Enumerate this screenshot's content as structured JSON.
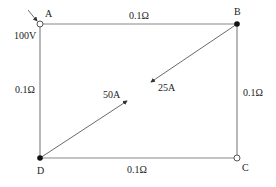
{
  "diagram": {
    "type": "circuit-network",
    "nodes": [
      {
        "id": "A",
        "label": "A",
        "x": 40,
        "y": 24,
        "style": "open"
      },
      {
        "id": "B",
        "label": "B",
        "x": 237,
        "y": 24,
        "style": "filled"
      },
      {
        "id": "C",
        "label": "C",
        "x": 237,
        "y": 158,
        "style": "open"
      },
      {
        "id": "D",
        "label": "D",
        "x": 40,
        "y": 158,
        "style": "filled"
      }
    ],
    "branches": [
      {
        "from": "A",
        "to": "B",
        "resistance": "0.1Ω"
      },
      {
        "from": "B",
        "to": "C",
        "resistance": "0.1Ω"
      },
      {
        "from": "D",
        "to": "C",
        "resistance": "0.1Ω"
      },
      {
        "from": "A",
        "to": "D",
        "resistance": "0.1Ω"
      }
    ],
    "source": {
      "node": "A",
      "voltage": "100V"
    },
    "loads": [
      {
        "node": "B",
        "current": "25A"
      },
      {
        "node": "D",
        "current": "50A"
      }
    ],
    "colors": {
      "wire": "#888888",
      "text": "#222222",
      "node_fill": "#111111"
    }
  }
}
